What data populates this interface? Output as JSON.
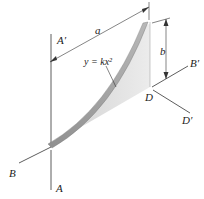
{
  "figure": {
    "labels": {
      "a_prime": "A′",
      "a": "A",
      "b_prime": "B′",
      "b": "B",
      "d": "D",
      "d_prime": "D′",
      "dim_a": "a",
      "dim_b": "b",
      "curve_eq": "y = kx²"
    },
    "colors": {
      "line": "#333333",
      "plate_light": "#e6e6e6",
      "plate_dark": "#bdbdbd",
      "rim": "#9a9a9a"
    }
  }
}
